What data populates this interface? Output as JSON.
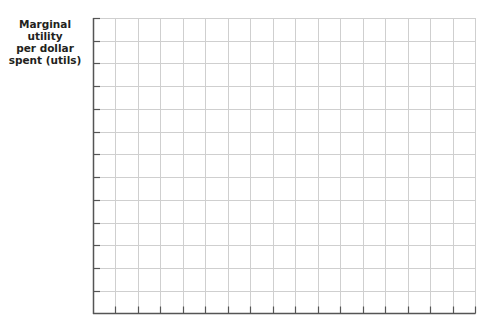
{
  "chart_data": {
    "type": "line",
    "title": "",
    "xlabel": "",
    "ylabel": "Marginal utility per dollar spent (utils)",
    "ylabel_lines": [
      "Marginal utility",
      "per dollar",
      "spent (utils)"
    ],
    "x_ticks": [],
    "y_ticks": [],
    "series": [],
    "grid": true,
    "grid_columns": 17,
    "grid_rows": 13,
    "colors": {
      "grid": "#cfcfcf",
      "axis": "#555555",
      "label": "#231f20"
    }
  }
}
